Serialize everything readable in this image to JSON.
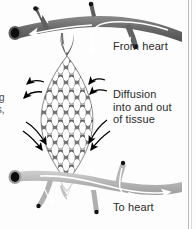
{
  "figure": {
    "background_color": "#fdfdfd",
    "labels": {
      "from_heart": "From heart",
      "diffusion": "Diffusion\ninto and out\nof tissue",
      "to_heart": "To heart",
      "clipped_left_text": "g\nts,"
    },
    "colors": {
      "artery": "#6f6f6f",
      "artery_dark": "#4a4a4a",
      "vein": "#b6b6b6",
      "vein_dark": "#9a9a9a",
      "capillary_mesh": "#6b6b6b",
      "lumen": "#111111",
      "flow_arrow": "#ffffff",
      "diffusion_arrow": "#000000",
      "text": "#2b2b2b",
      "border": "#b9b9b9"
    },
    "elements": {
      "artery_label": "artery carrying blood from heart",
      "vein_label": "vein carrying blood to heart",
      "capillary_bed_label": "capillary bed mesh",
      "flow_direction_top": "right-to-left and into capillary bed",
      "flow_direction_bottom": "left-to-right toward heart",
      "diffusion_arrows_count": 8
    }
  }
}
